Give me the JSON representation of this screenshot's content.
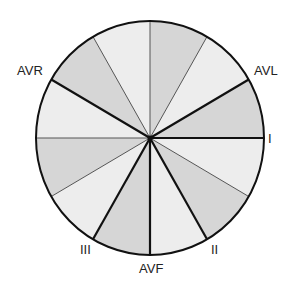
{
  "diagram": {
    "center": [
      150,
      138
    ],
    "radius_x": 114,
    "radius_y": 117,
    "colors": {
      "light": "#ededed",
      "dark": "#d6d6d6",
      "line": "#111111",
      "thin": "#555555"
    },
    "sectors": [
      {
        "from": 0,
        "to": -30,
        "shade": "dark"
      },
      {
        "from": -30,
        "to": -60,
        "shade": "light"
      },
      {
        "from": -60,
        "to": -90,
        "shade": "dark"
      },
      {
        "from": -90,
        "to": -120,
        "shade": "light"
      },
      {
        "from": -120,
        "to": -150,
        "shade": "dark"
      },
      {
        "from": -150,
        "to": -180,
        "shade": "light"
      },
      {
        "from": 180,
        "to": 150,
        "shade": "dark"
      },
      {
        "from": 150,
        "to": 120,
        "shade": "light"
      },
      {
        "from": 120,
        "to": 90,
        "shade": "dark"
      },
      {
        "from": 90,
        "to": 60,
        "shade": "light"
      },
      {
        "from": 60,
        "to": 30,
        "shade": "dark"
      },
      {
        "from": 30,
        "to": 0,
        "shade": "light"
      }
    ],
    "thick_lines": [
      0,
      -30,
      -150,
      60,
      90,
      120
    ],
    "thin_lines": [
      -60,
      -90,
      -120,
      180,
      150,
      30
    ],
    "labels": [
      {
        "text": "I",
        "x": 268,
        "y": 132
      },
      {
        "text": "AVL",
        "x": 254,
        "y": 64
      },
      {
        "text": "AVR",
        "x": 17,
        "y": 64
      },
      {
        "text": "II",
        "x": 211,
        "y": 243
      },
      {
        "text": "III",
        "x": 80,
        "y": 243
      },
      {
        "text": "AVF",
        "x": 139,
        "y": 262
      }
    ]
  }
}
